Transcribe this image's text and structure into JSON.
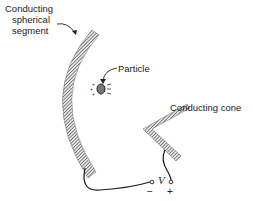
{
  "diagram": {
    "labels": {
      "sphere_line1": "Conducting",
      "sphere_line2": "spherical",
      "sphere_line3": "segment",
      "particle": "Particle",
      "cone": "Conducting cone",
      "voltage": "V",
      "minus": "−",
      "plus": "+"
    },
    "colors": {
      "hatch": "#7a7a7a",
      "wire": "#1a1a1a",
      "particle_fill": "#777777"
    }
  }
}
